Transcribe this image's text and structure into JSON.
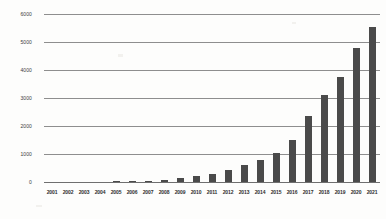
{
  "chart_data": {
    "type": "bar",
    "title": "",
    "subtitle": "",
    "xlabel": "",
    "ylabel": "",
    "categories": [
      "2001",
      "2002",
      "2003",
      "2004",
      "2005",
      "2006",
      "2007",
      "2008",
      "2009",
      "2010",
      "2011",
      "2012",
      "2013",
      "2014",
      "2015",
      "2016",
      "2017",
      "2018",
      "2019",
      "2020",
      "2021"
    ],
    "values": [
      0,
      0,
      0,
      0,
      2,
      18,
      35,
      70,
      140,
      205,
      300,
      430,
      610,
      790,
      1030,
      1510,
      2370,
      3110,
      3760,
      4800,
      5540
    ],
    "series": [
      {
        "name": "Count",
        "values": [
          0,
          0,
          0,
          0,
          2,
          18,
          35,
          70,
          140,
          205,
          300,
          430,
          610,
          790,
          1030,
          1510,
          2370,
          3110,
          3760,
          4800,
          5540
        ]
      }
    ],
    "ylim": [
      0,
      6000
    ],
    "y_ticks": [
      0,
      1000,
      2000,
      3000,
      4000,
      5000,
      6000
    ],
    "y_tick_labels": [
      "0",
      "1000",
      "2000",
      "3000",
      "4000",
      "5000",
      "6000"
    ],
    "grid": true,
    "grid_axis": "y",
    "legend": false,
    "legend_position": "none",
    "bar_color": "#4a4a4a",
    "gridline_color": "#8e8e8e",
    "background_color": "#fdfdfc",
    "annotations": []
  }
}
